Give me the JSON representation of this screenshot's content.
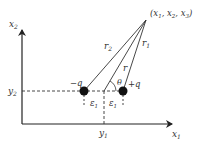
{
  "diagram": {
    "title": "",
    "axes": {
      "x_label": "x",
      "x_sub": "1",
      "y_label": "x",
      "y_sub": "2"
    },
    "point": {
      "label": "(x",
      "parts": [
        "1",
        "2",
        "3"
      ],
      "text": "(x1, x2, x3)"
    },
    "charges": {
      "negative": "−q",
      "positive": "+q"
    },
    "distances": {
      "r": "r",
      "r1": "r",
      "r1_sub": "1",
      "r2": "r",
      "r2_sub": "2"
    },
    "angle": "θ",
    "offsets": {
      "left": "ε",
      "left_sub": "1",
      "right": "ε",
      "right_sub": "1"
    },
    "ticks": {
      "y1": "y",
      "y1_sub": "1",
      "y2": "y",
      "y2_sub": "2"
    },
    "colors": {
      "line": "#333333",
      "charge": "#111111"
    }
  }
}
